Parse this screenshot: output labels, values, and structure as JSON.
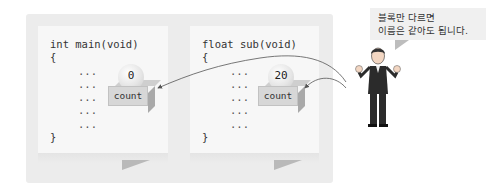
{
  "diagram": {
    "left_function": {
      "signature": "int main(void)",
      "open_brace": "{",
      "body_lines": [
        "...",
        "...",
        "...",
        "...",
        "..."
      ],
      "close_brace": "}",
      "variable": {
        "name": "count",
        "value": "0"
      }
    },
    "right_function": {
      "signature": "float sub(void)",
      "open_brace": "{",
      "body_lines": [
        "...",
        "...",
        "...",
        "...",
        "..."
      ],
      "close_brace": "}",
      "variable": {
        "name": "count",
        "value": "20"
      }
    },
    "speech_bubble": {
      "line1": "블록만 다르면",
      "line2": "이름은 같아도 됩니다."
    },
    "colors": {
      "outer_panel": "#ececec",
      "card": "#f7f7f7",
      "box": "#d7d7d7",
      "arrow": "#555555"
    }
  }
}
